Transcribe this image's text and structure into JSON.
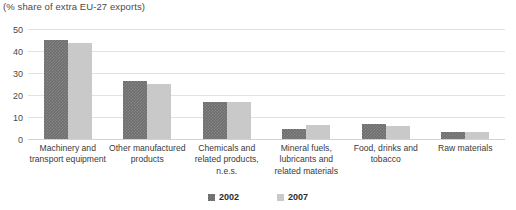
{
  "chart_data": {
    "type": "bar",
    "title": "",
    "subtitle": "(% share of extra EU-27 exports)",
    "xlabel": "",
    "ylabel": "",
    "ylim": [
      0,
      50
    ],
    "yticks": [
      50,
      40,
      30,
      20,
      10,
      0
    ],
    "grid": true,
    "legend_position": "bottom-center",
    "categories": [
      "Machinery and transport equipment",
      "Other manufactured products",
      "Chemicals and related products, n.e.s.",
      "Mineral fuels, lubricants and related materials",
      "Food, drinks and tobacco",
      "Raw materials"
    ],
    "series": [
      {
        "name": "2002",
        "color": "#6e6e6e",
        "values": [
          45.0,
          26.5,
          16.8,
          4.5,
          6.8,
          3.0
        ]
      },
      {
        "name": "2007",
        "color": "#c9c9c9",
        "values": [
          43.8,
          25.2,
          16.8,
          6.3,
          6.0,
          3.0
        ]
      }
    ]
  },
  "axis": {
    "ticks": [
      {
        "label": "50",
        "value": 50
      },
      {
        "label": "40",
        "value": 40
      },
      {
        "label": "30",
        "value": 30
      },
      {
        "label": "20",
        "value": 20
      },
      {
        "label": "10",
        "value": 10
      },
      {
        "label": "0",
        "value": 0
      }
    ]
  },
  "categories_display": [
    {
      "lines": [
        "Machinery and",
        "transport equipment"
      ]
    },
    {
      "lines": [
        "Other manufactured",
        "products"
      ]
    },
    {
      "lines": [
        "Chemicals and",
        "related products,",
        "n.e.s."
      ]
    },
    {
      "lines": [
        "Mineral fuels,",
        "lubricants and",
        "related materials"
      ]
    },
    {
      "lines": [
        "Food, drinks and",
        "tobacco"
      ]
    },
    {
      "lines": [
        "Raw materials"
      ]
    }
  ],
  "legend": {
    "items": [
      {
        "label": "2002",
        "color": "#6e6e6e"
      },
      {
        "label": "2007",
        "color": "#c9c9c9"
      }
    ]
  }
}
